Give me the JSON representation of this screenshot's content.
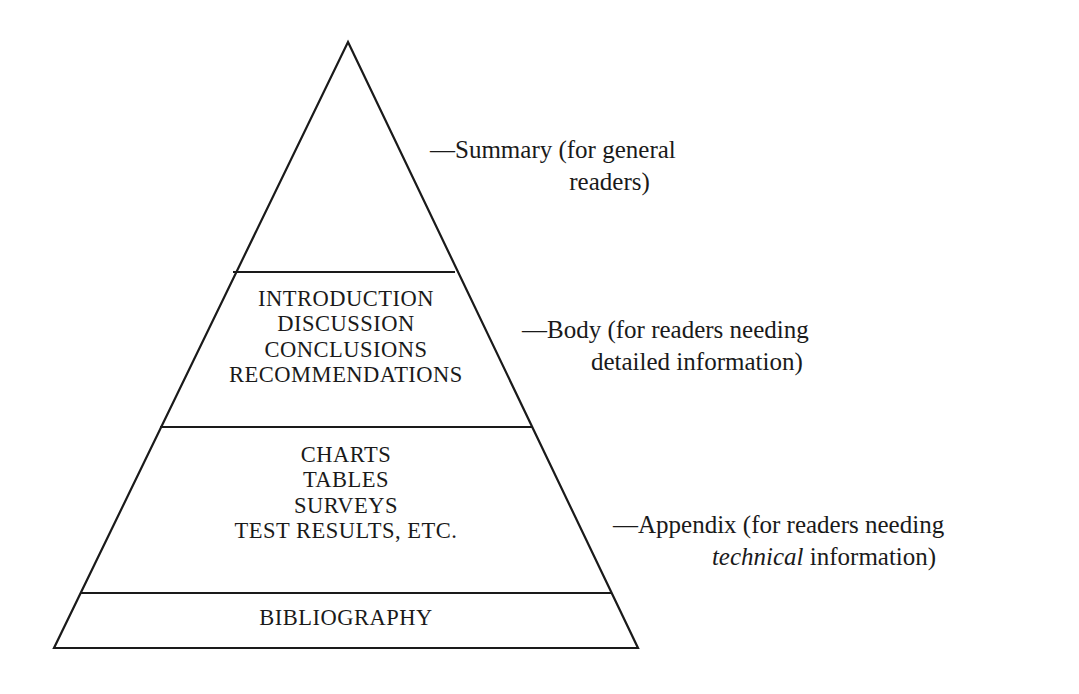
{
  "diagram": {
    "type": "pyramid",
    "background_color": "#ffffff",
    "line_color": "#1a1a1a",
    "text_color": "#1a1a1a",
    "tiers": [
      {
        "id": "summary",
        "lines": [],
        "callout": {
          "dash": "—",
          "line1": "Summary (for general",
          "line2": "readers)"
        }
      },
      {
        "id": "body",
        "lines": [
          "INTRODUCTION",
          "DISCUSSION",
          "CONCLUSIONS",
          "RECOMMENDATIONS"
        ],
        "callout": {
          "dash": "—",
          "line1": "Body (for readers needing",
          "line2": "detailed information)"
        }
      },
      {
        "id": "appendix",
        "lines": [
          "CHARTS",
          "TABLES",
          "SURVEYS",
          "TEST RESULTS, ETC."
        ],
        "callout": {
          "dash": "—",
          "line1": "Appendix (for readers needing",
          "line2_italic": "technical",
          "line2_rest": " information)"
        }
      },
      {
        "id": "bibliography",
        "lines": [
          "BIBLIOGRAPHY"
        ],
        "callout": null
      }
    ]
  }
}
